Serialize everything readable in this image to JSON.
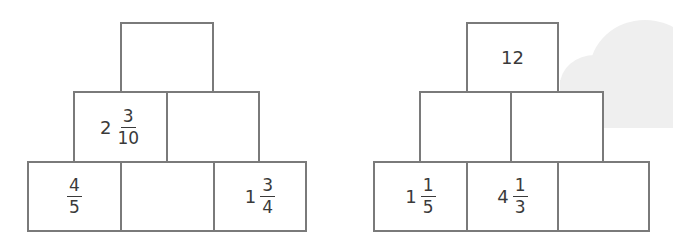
{
  "pyramids": [
    {
      "name": "left",
      "top": [
        {
          "whole": "",
          "num": "",
          "den": ""
        }
      ],
      "middle": [
        {
          "whole": "2",
          "num": "3",
          "den": "10"
        },
        {
          "whole": "",
          "num": "",
          "den": ""
        }
      ],
      "bottom": [
        {
          "whole": "",
          "num": "4",
          "den": "5"
        },
        {
          "whole": "",
          "num": "",
          "den": ""
        },
        {
          "whole": "1",
          "num": "3",
          "den": "4"
        }
      ]
    },
    {
      "name": "right",
      "top": [
        {
          "whole": "12",
          "num": "",
          "den": ""
        }
      ],
      "middle": [
        {
          "whole": "",
          "num": "",
          "den": ""
        },
        {
          "whole": "",
          "num": "",
          "den": ""
        }
      ],
      "bottom": [
        {
          "whole": "1",
          "num": "1",
          "den": "5"
        },
        {
          "whole": "4",
          "num": "1",
          "den": "3"
        },
        {
          "whole": "",
          "num": "",
          "den": ""
        }
      ]
    }
  ],
  "colors": {
    "border": "#7a7a7a",
    "text": "#3a3a3a",
    "cloud": "#efefef"
  }
}
